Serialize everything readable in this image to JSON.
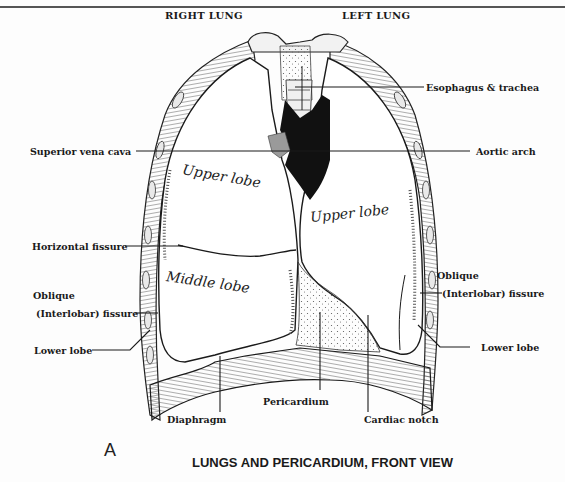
{
  "figure": {
    "panel_letter": "A",
    "caption": "LUNGS AND PERICARDIUM, FRONT VIEW"
  },
  "headers": {
    "right_lung": "RIGHT LUNG",
    "left_lung": "LEFT LUNG"
  },
  "labels": {
    "esophagus_trachea": "Esophagus & trachea",
    "superior_vena_cava": "Superior vena cava",
    "aortic_arch": "Aortic arch",
    "horizontal_fissure": "Horizontal fissure",
    "oblique_left_line1": "Oblique",
    "oblique_left_line2": "(Interlobar) fissure",
    "lower_lobe_left": "Lower lobe",
    "oblique_right_line1": "Oblique",
    "oblique_right_line2": "(Interlobar) fissure",
    "lower_lobe_right": "Lower lobe",
    "diaphragm": "Diaphragm",
    "pericardium": "Pericardium",
    "cardiac_notch": "Cardiac notch"
  },
  "lobe_annotations": {
    "right_upper": "Upper lobe",
    "right_middle": "Middle lobe",
    "left_upper": "Upper lobe"
  },
  "colors": {
    "ink": "#1a1a1a",
    "aorta_fill": "#111111",
    "vena_cava_fill": "#9a9a9a",
    "paper": "#fdfdfd"
  }
}
